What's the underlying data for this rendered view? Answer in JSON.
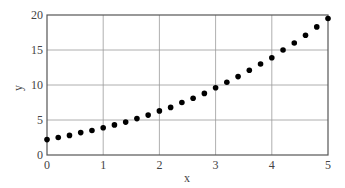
{
  "chart_data": {
    "type": "scatter",
    "title": "",
    "xlabel": "x",
    "ylabel": "y",
    "xlim": [
      0,
      5
    ],
    "ylim": [
      0,
      20
    ],
    "grid": true,
    "legend": null,
    "x_ticks": [
      "0",
      "1",
      "2",
      "3",
      "4",
      "5"
    ],
    "y_ticks": [
      "0",
      "5",
      "10",
      "15",
      "20"
    ],
    "series": [
      {
        "name": "data",
        "marker": "filled-circle",
        "color": "#000000",
        "x": [
          0,
          0.2,
          0.4,
          0.6,
          0.8,
          1.0,
          1.2,
          1.4,
          1.6,
          1.8,
          2.0,
          2.2,
          2.4,
          2.6,
          2.8,
          3.0,
          3.2,
          3.4,
          3.6,
          3.8,
          4.0,
          4.2,
          4.4,
          4.6,
          4.8,
          5.0
        ],
        "y": [
          2.2,
          2.5,
          2.8,
          3.2,
          3.5,
          3.9,
          4.3,
          4.7,
          5.2,
          5.7,
          6.3,
          6.8,
          7.5,
          8.1,
          8.8,
          9.6,
          10.4,
          11.2,
          12.1,
          13.0,
          13.9,
          15.0,
          16.0,
          17.1,
          18.3,
          19.5
        ]
      }
    ]
  }
}
